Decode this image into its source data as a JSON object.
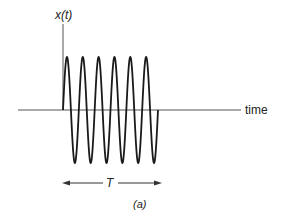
{
  "figure": {
    "y_axis_label": "x(t)",
    "x_axis_label": "time",
    "duration_label": "T",
    "subfigure_label": "(a)",
    "colors": {
      "background": "#ffffff",
      "waveform": "#1a1a1a",
      "axes": "#555555",
      "text": "#222222"
    }
  },
  "chart_data": {
    "type": "line",
    "title": "",
    "xlabel": "time",
    "ylabel": "x(t)",
    "cycles": 6,
    "burst_duration_label": "T",
    "amplitude": 1,
    "x": [
      0,
      0.0417,
      0.0833,
      0.125,
      0.1667,
      0.2083,
      0.25,
      0.2917,
      0.3333,
      0.375,
      0.4167,
      0.4583,
      0.5,
      0.5417,
      0.5833,
      0.625,
      0.6667,
      0.7083,
      0.75,
      0.7917,
      0.8333,
      0.875,
      0.9167,
      0.9583,
      1.0
    ],
    "values": [
      0,
      1,
      0,
      -1,
      0,
      1,
      0,
      -1,
      0,
      1,
      0,
      -1,
      0,
      1,
      0,
      -1,
      0,
      1,
      0,
      -1,
      0,
      1,
      0,
      -1,
      0
    ],
    "x_units": "fraction of T",
    "grid": false,
    "legend": false,
    "annotations": [
      "T (double-headed arrow spanning burst duration)",
      "(a)"
    ]
  }
}
